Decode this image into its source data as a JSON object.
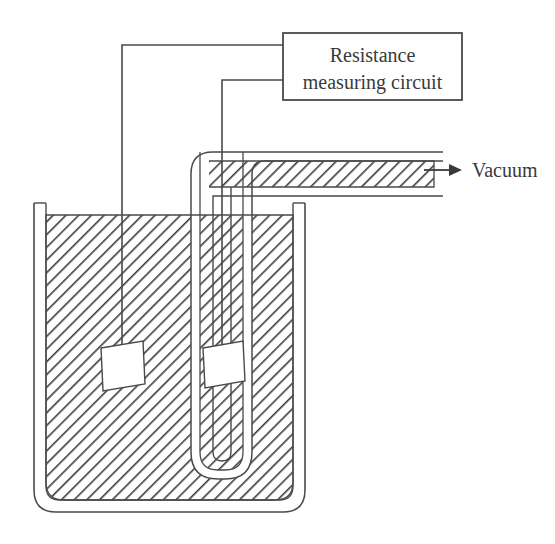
{
  "diagram": {
    "type": "schematic",
    "background_color": "#ffffff",
    "line_color": "#4a4a4a",
    "hatch_color": "#3c3c3c",
    "fill_color": "#ffffff"
  },
  "instrument_box": {
    "label_line1": "Resistance",
    "label_line2": "measuring circuit",
    "x": 283,
    "y": 33,
    "width": 179,
    "height": 67,
    "border_color": "#4a4a4a"
  },
  "vacuum": {
    "label": "Vacuum",
    "arrow_icon": "right-arrow-icon",
    "arrow_x": 430,
    "arrow_y": 170,
    "label_x": 470,
    "label_y": 176
  },
  "wires": [
    {
      "name": "wire-left-probe",
      "from_terminal_y": 45,
      "corner_x": 122,
      "ends_at_sensor": "left-sensor"
    },
    {
      "name": "wire-right-probe",
      "from_terminal_y": 80,
      "corner_x": 222,
      "ends_at_sensor": "right-sensor"
    }
  ],
  "beaker": {
    "name": "beaker-container",
    "left_x": 34,
    "right_x": 305,
    "rim_y": 203,
    "bottom_y": 512,
    "wall_thickness": 12,
    "corner_radius": 18
  },
  "fill_material": {
    "name": "hatched-medium",
    "hatch_angle_deg": 45,
    "hatch_spacing_px": 9,
    "hatch_stroke_width": 1.6
  },
  "u_tube": {
    "name": "u-shaped-tube",
    "inner_left_x": 200,
    "inner_right_x": 243,
    "top_y": 152,
    "bottom_y": 470,
    "wall_thickness": 9,
    "horizontal_arm_end_x": 443,
    "horizontal_arm_top_y": 152,
    "horizontal_arm_bottom_y": 196
  },
  "sensors": [
    {
      "name": "left-sensor",
      "shape": "tilted-quadrilateral",
      "cx": 122,
      "cy": 360,
      "width": 42,
      "height": 46
    },
    {
      "name": "right-sensor",
      "shape": "tilted-quadrilateral",
      "cx": 222,
      "cy": 360,
      "width": 40,
      "height": 45
    }
  ]
}
